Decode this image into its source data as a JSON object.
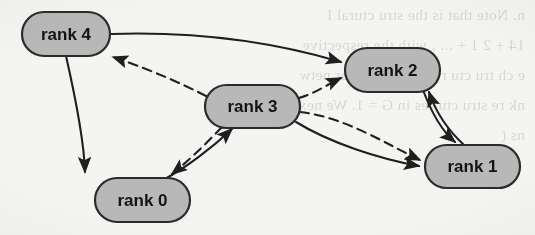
{
  "figure": {
    "kind": "directed-graph",
    "title_visible": false,
    "background_color": "#f4f4f2",
    "node_fill": "#b8b8b8",
    "node_stroke": "#2b2b2b",
    "edge_color": "#1f1f1f",
    "label_color": "#141414"
  },
  "nodes": [
    {
      "id": "rank4",
      "label": "rank 4",
      "x": 22,
      "y": 12,
      "w": 88,
      "h": 44
    },
    {
      "id": "rank2",
      "label": "rank 2",
      "x": 345,
      "y": 48,
      "w": 95,
      "h": 44
    },
    {
      "id": "rank3",
      "label": "rank 3",
      "x": 205,
      "y": 85,
      "w": 95,
      "h": 43
    },
    {
      "id": "rank1",
      "label": "rank 1",
      "x": 425,
      "y": 145,
      "w": 95,
      "h": 43
    },
    {
      "id": "rank0",
      "label": "rank 0",
      "x": 95,
      "y": 178,
      "w": 95,
      "h": 44
    }
  ],
  "edges": [
    {
      "id": "e-rank4-rank2",
      "from": "rank4",
      "to": "rank2",
      "style": "solid",
      "arrow": "single"
    },
    {
      "id": "e-rank3-rank4",
      "from": "rank3",
      "to": "rank4",
      "style": "dashed",
      "arrow": "single"
    },
    {
      "id": "e-rank4-rank0",
      "from": "rank4",
      "to": "rank0",
      "style": "solid",
      "arrow": "single"
    },
    {
      "id": "e-rank3-rank2",
      "from": "rank3",
      "to": "rank2",
      "style": "dashed",
      "arrow": "single"
    },
    {
      "id": "e-rank3-rank1-s",
      "from": "rank3",
      "to": "rank1",
      "style": "solid",
      "arrow": "single"
    },
    {
      "id": "e-rank3-rank1-d",
      "from": "rank3",
      "to": "rank1",
      "style": "dashed",
      "arrow": "single"
    },
    {
      "id": "e-rank2-rank1",
      "from": "rank2",
      "to": "rank1",
      "style": "solid",
      "arrow": "single"
    },
    {
      "id": "e-rank1-rank2",
      "from": "rank1",
      "to": "rank2",
      "style": "solid",
      "arrow": "single"
    },
    {
      "id": "e-rank3-rank0",
      "from": "rank3",
      "to": "rank0",
      "style": "dashed",
      "arrow": "single"
    },
    {
      "id": "e-rank0-rank3",
      "from": "rank0",
      "to": "rank3",
      "style": "solid",
      "arrow": "single"
    }
  ],
  "bleed_text": {
    "note": "faint mirrored show-through text from reverse of scanned page",
    "lines": [
      "n. Note that   is the   stru  ctural  I",
      "14 + 2 1 + ... , with  the  respective",
      "e ch  tru  ctu  res  in  the  regular  netw",
      "nk  re  stru  ctu  res  in  G  = 1.  We  next  obtai",
      "ns ("
    ]
  }
}
